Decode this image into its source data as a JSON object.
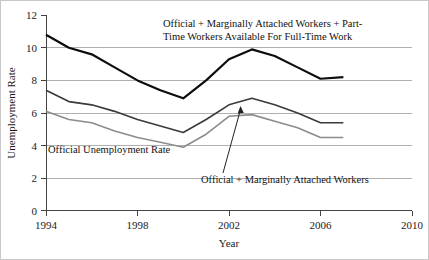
{
  "chart_data": {
    "type": "line",
    "title": "",
    "xlabel": "Year",
    "ylabel": "Unemployment Rate",
    "xlim": [
      1994,
      2010
    ],
    "ylim": [
      0,
      12
    ],
    "xticks": [
      "1994",
      "1998",
      "2002",
      "2006",
      "2010"
    ],
    "xtick_values": [
      1994,
      1998,
      2002,
      2006,
      2010
    ],
    "yticks": [
      "0",
      "2",
      "4",
      "6",
      "8",
      "10",
      "12"
    ],
    "ytick_values": [
      0,
      2,
      4,
      6,
      8,
      10,
      12
    ],
    "grid": "horizontal",
    "legend_position": "inline-annotations",
    "x": [
      1994,
      1995,
      1996,
      1997,
      1998,
      1999,
      2000,
      2001,
      2002,
      2003,
      2004,
      2005,
      2006,
      2007
    ],
    "series": [
      {
        "name": "Official + Marginally Attached Workers + Part-Time Workers Available For Full-Time Work",
        "color": "#0d0d0d",
        "width": 2.2,
        "values": [
          10.8,
          10.0,
          9.6,
          8.8,
          8.0,
          7.4,
          6.9,
          8.0,
          9.3,
          9.9,
          9.5,
          8.8,
          8.1,
          8.2
        ]
      },
      {
        "name": "Official + Marginally Attached Workers",
        "color": "#3a3a3a",
        "width": 1.6,
        "values": [
          7.4,
          6.7,
          6.5,
          6.1,
          5.6,
          5.2,
          4.8,
          5.6,
          6.5,
          6.9,
          6.5,
          6.0,
          5.4,
          5.4
        ]
      },
      {
        "name": "Official Unemployment Rate",
        "color": "#8c8c8c",
        "width": 1.6,
        "values": [
          6.1,
          5.6,
          5.4,
          4.9,
          4.5,
          4.2,
          3.9,
          4.7,
          5.8,
          5.9,
          5.5,
          5.1,
          4.5,
          4.5
        ]
      }
    ],
    "annotations": [
      {
        "id": "u6-label",
        "lines": [
          "Official + Marginally Attached Workers + Part-",
          "Time Workers Available For Full-Time Work"
        ]
      },
      {
        "id": "u3-label",
        "lines": [
          "Official Unemployment Rate"
        ]
      },
      {
        "id": "u5-label",
        "lines": [
          "Official + Marginally Attached Workers"
        ]
      }
    ]
  }
}
